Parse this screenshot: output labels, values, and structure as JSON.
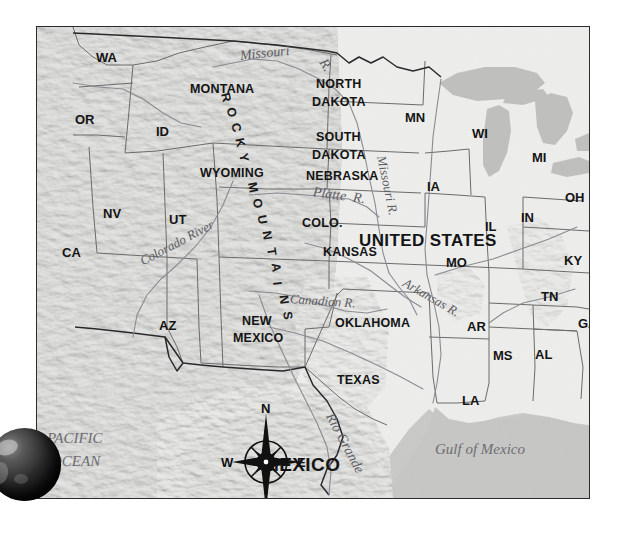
{
  "map": {
    "title_country_us": "UNITED STATES",
    "title_country_mx": "MEXICO",
    "colors": {
      "ocean": "#c9c9c7",
      "western_relief": "#b9b9b6",
      "eastern_plain": "#f1f1ef",
      "great_lakes": "#bdbdbb",
      "border_line": "#2b2b2b",
      "label_text": "#141414",
      "river_text": "#5d5d63"
    },
    "state_labels": [
      {
        "name": "WA",
        "x": 59,
        "y": 24
      },
      {
        "name": "OR",
        "x": 38,
        "y": 86
      },
      {
        "name": "ID",
        "x": 119,
        "y": 98
      },
      {
        "name": "MONTANA",
        "x": 153,
        "y": 56
      },
      {
        "name": "WYOMING",
        "x": 163,
        "y": 140
      },
      {
        "name": "NV",
        "x": 66,
        "y": 180
      },
      {
        "name": "UT",
        "x": 132,
        "y": 186
      },
      {
        "name": "CA",
        "x": 25,
        "y": 219
      },
      {
        "name": "AZ",
        "x": 122,
        "y": 292
      },
      {
        "name": "COLO.",
        "x": 265,
        "y": 190
      },
      {
        "name": "NEW",
        "x": 205,
        "y": 288
      },
      {
        "name": "MEXICO",
        "x": 196,
        "y": 305
      },
      {
        "name": "NORTH",
        "x": 279,
        "y": 51
      },
      {
        "name": "DAKOTA",
        "x": 275,
        "y": 69
      },
      {
        "name": "SOUTH",
        "x": 279,
        "y": 104
      },
      {
        "name": "DAKOTA",
        "x": 275,
        "y": 122
      },
      {
        "name": "NEBRASKA",
        "x": 269,
        "y": 143
      },
      {
        "name": "KANSAS",
        "x": 286,
        "y": 219
      },
      {
        "name": "OKLAHOMA",
        "x": 298,
        "y": 290
      },
      {
        "name": "TEXAS",
        "x": 300,
        "y": 347
      },
      {
        "name": "MN",
        "x": 368,
        "y": 84
      },
      {
        "name": "IA",
        "x": 390,
        "y": 153
      },
      {
        "name": "WI",
        "x": 435,
        "y": 100
      },
      {
        "name": "MI",
        "x": 495,
        "y": 124
      },
      {
        "name": "IL",
        "x": 448,
        "y": 193
      },
      {
        "name": "IN",
        "x": 484,
        "y": 184
      },
      {
        "name": "OH",
        "x": 528,
        "y": 164
      },
      {
        "name": "MO",
        "x": 409,
        "y": 229
      },
      {
        "name": "KY",
        "x": 527,
        "y": 227
      },
      {
        "name": "TN",
        "x": 504,
        "y": 263
      },
      {
        "name": "AR",
        "x": 430,
        "y": 293
      },
      {
        "name": "GA",
        "x": 541,
        "y": 290
      },
      {
        "name": "MS",
        "x": 456,
        "y": 322
      },
      {
        "name": "AL",
        "x": 498,
        "y": 321
      },
      {
        "name": "LA",
        "x": 425,
        "y": 367
      }
    ],
    "water_labels": [
      {
        "name": "Missouri",
        "x": 203,
        "y": 22,
        "rot": -6,
        "size": 14
      },
      {
        "name": "R.",
        "x": 285,
        "y": 26,
        "rot": 58,
        "size": 14
      },
      {
        "name": "Missouri R.",
        "x": 344,
        "y": 122,
        "rot": 78,
        "size": 13
      },
      {
        "name": "Platte  R.",
        "x": 276,
        "y": 158,
        "rot": 8,
        "size": 14
      },
      {
        "name": "Colorado River",
        "x": 104,
        "y": 228,
        "rot": -28,
        "size": 13
      },
      {
        "name": "Arkansas R.",
        "x": 367,
        "y": 248,
        "rot": 30,
        "size": 13
      },
      {
        "name": "Canadian R.",
        "x": 253,
        "y": 265,
        "rot": 4,
        "size": 13
      },
      {
        "name": "Rio Grande",
        "x": 292,
        "y": 380,
        "rot": 62,
        "size": 14
      }
    ],
    "ocean_labels": [
      {
        "name": "PACIFIC",
        "x": 10,
        "y": 404
      },
      {
        "name": "OCEAN",
        "x": 14,
        "y": 427
      },
      {
        "name": "Gulf of Mexico",
        "x": 398,
        "y": 415
      }
    ],
    "mountain_range": {
      "label": "ROCKY MOUNTAINS",
      "letters": [
        "R",
        "O",
        "C",
        "K",
        "Y",
        " ",
        "M",
        "O",
        "U",
        "N",
        "T",
        "A",
        "I",
        "N",
        "S"
      ]
    },
    "compass": {
      "north": "N",
      "south": "S",
      "east": "E",
      "west": "W",
      "icon": "compass-rose-icon"
    },
    "globe": {
      "icon": "globe-icon"
    }
  }
}
